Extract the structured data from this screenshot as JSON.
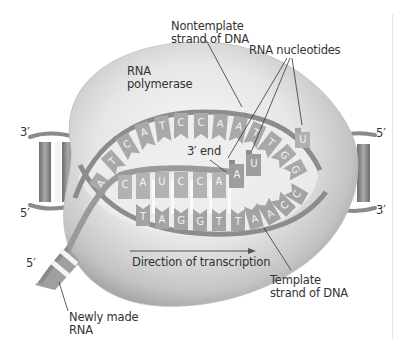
{
  "labels": {
    "rna_polymerase": [
      "RNA",
      "polymerase"
    ],
    "nontemplate_strand": [
      "Nontemplate",
      "strand of DNA"
    ],
    "rna_nucleotides": "RNA nucleotides",
    "three_prime_end": "3′ end",
    "direction": "Direction of transcription",
    "template_strand": [
      "Template",
      "strand of DNA"
    ],
    "newly_made_rna": [
      "Newly made",
      "RNA"
    ]
  },
  "strand_ends": {
    "left_top": "3′",
    "left_bottom": "5′",
    "right_top": "5′",
    "right_bottom": "3′",
    "rna_5prime": "5′"
  },
  "sequences": {
    "nontemplate_top": [
      "A",
      "T",
      "C",
      "A",
      "T",
      "C",
      "C",
      "A",
      "A",
      "T",
      "T",
      "G",
      "G"
    ],
    "rna_in_bubble": [
      "C",
      "A",
      "U",
      "C",
      "C",
      "A"
    ],
    "template_bottom": [
      "T",
      "A",
      "G",
      "G",
      "T",
      "T",
      "A",
      "A",
      "C",
      "C"
    ],
    "incoming_nucleotides": [
      "A",
      "U",
      "U"
    ]
  },
  "colors": {
    "polymerase_light": "#f2f2f2",
    "polymerase_dark": "#9a9a9a",
    "dna_strand": "#8a8a8a",
    "base_fill": "#a8a8a8",
    "rna_fill": "#b5b5b5",
    "text": "#333333"
  }
}
